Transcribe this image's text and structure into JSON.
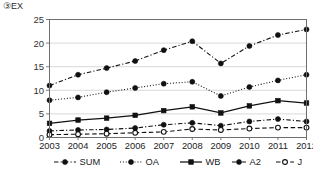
{
  "chart_data": {
    "type": "line",
    "title": "③EX",
    "xlabel": "",
    "ylabel": "",
    "categories": [
      "2003",
      "2004",
      "2005",
      "2006",
      "2007",
      "2008",
      "2009",
      "2010",
      "2011",
      "2012"
    ],
    "x": [
      2003,
      2004,
      2005,
      2006,
      2007,
      2008,
      2009,
      2010,
      2011,
      2012
    ],
    "xlim": [
      2003,
      2012
    ],
    "ylim": [
      0,
      25
    ],
    "yticks": [
      0,
      5,
      10,
      15,
      20,
      25
    ],
    "ytick_labels": [
      "0",
      "5",
      "10",
      "15",
      "20",
      "25"
    ],
    "grid": true,
    "grid_axis": "y",
    "legend_position": "bottom",
    "series": [
      {
        "name": "SUM",
        "values": [
          11.0,
          13.3,
          14.7,
          16.2,
          18.5,
          20.4,
          15.7,
          19.4,
          21.7,
          22.9
        ],
        "line_style": "dashdot",
        "marker": "filled-circle",
        "color": "#111111"
      },
      {
        "name": "OA",
        "values": [
          7.9,
          8.5,
          9.6,
          10.5,
          11.4,
          11.8,
          8.8,
          10.7,
          12.1,
          13.3
        ],
        "line_style": "dotted",
        "marker": "filled-circle",
        "color": "#111111"
      },
      {
        "name": "WB",
        "values": [
          3.0,
          3.7,
          4.1,
          4.7,
          5.7,
          6.5,
          5.2,
          6.7,
          7.8,
          7.3
        ],
        "line_style": "solid",
        "marker": "filled-square",
        "color": "#111111"
      },
      {
        "name": "A2",
        "values": [
          1.4,
          1.6,
          1.7,
          2.0,
          2.7,
          3.1,
          2.5,
          3.4,
          3.9,
          3.4
        ],
        "line_style": "dashdot",
        "marker": "filled-circle",
        "color": "#111111"
      },
      {
        "name": "J",
        "values": [
          0.6,
          0.7,
          0.8,
          1.0,
          1.2,
          1.8,
          1.6,
          1.9,
          2.1,
          2.1
        ],
        "line_style": "dashed",
        "marker": "hollow-circle",
        "color": "#111111"
      }
    ]
  }
}
